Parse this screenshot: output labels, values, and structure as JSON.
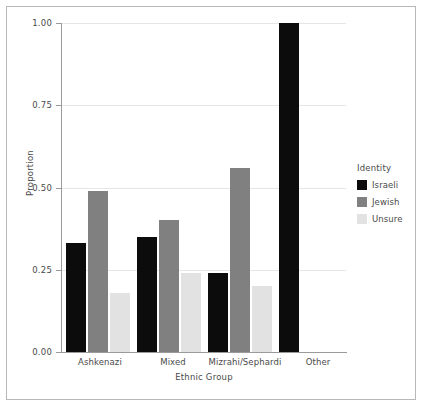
{
  "chart_data": {
    "type": "bar",
    "title": "",
    "xlabel": "Ethnic Group",
    "ylabel": "Proportion",
    "categories": [
      "Ashkenazi",
      "Mixed",
      "Mizrahi/Sephardi",
      "Other"
    ],
    "series": [
      {
        "name": "Israeli",
        "color": "#0c0c0c",
        "values": [
          0.33,
          0.35,
          0.24,
          1.0
        ]
      },
      {
        "name": "Jewish",
        "color": "#808080",
        "values": [
          0.49,
          0.4,
          0.56,
          0.0
        ]
      },
      {
        "name": "Unsure",
        "color": "#e2e2e2",
        "values": [
          0.18,
          0.24,
          0.2,
          0.0
        ]
      }
    ],
    "ylim": [
      0.0,
      1.0
    ],
    "yticks": [
      0.0,
      0.25,
      0.5,
      0.75,
      1.0
    ],
    "ytick_labels": [
      "0.00",
      "0.25",
      "0.50",
      "0.75",
      "1.00"
    ],
    "grid": true,
    "legend": {
      "title": "Identity",
      "position": "right",
      "entries": [
        "Israeli",
        "Jewish",
        "Unsure"
      ]
    }
  },
  "axes": {
    "y_title": "Proportion",
    "x_title": "Ethnic Group",
    "ytick_labels": {
      "t0": "0.00",
      "t1": "0.25",
      "t2": "0.50",
      "t3": "0.75",
      "t4": "1.00"
    },
    "xtick_labels": {
      "c0": "Ashkenazi",
      "c1": "Mixed",
      "c2": "Mizrahi/Sephardi",
      "c3": "Other"
    }
  },
  "legend": {
    "title": "Identity",
    "items": [
      {
        "label": "Israeli"
      },
      {
        "label": "Jewish"
      },
      {
        "label": "Unsure"
      }
    ]
  }
}
